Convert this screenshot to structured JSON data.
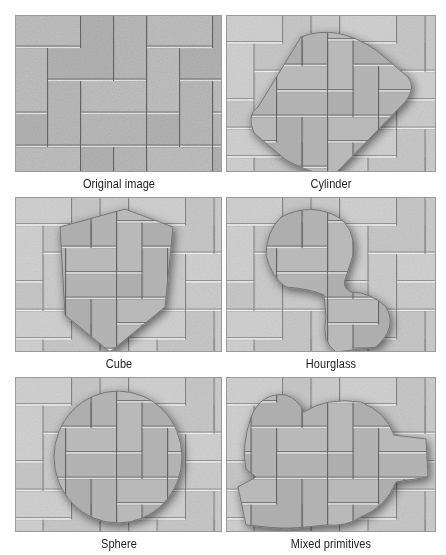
{
  "figure": {
    "panels": [
      {
        "id": "original",
        "caption": "Original image",
        "shape": "none",
        "x": 15,
        "y": 15,
        "w": 207,
        "h": 157,
        "caption_y": 177
      },
      {
        "id": "cylinder",
        "caption": "Cylinder",
        "shape": "cylinder",
        "x": 226,
        "y": 15,
        "w": 210,
        "h": 157,
        "caption_y": 177
      },
      {
        "id": "cube",
        "caption": "Cube",
        "shape": "cube",
        "x": 15,
        "y": 197,
        "w": 207,
        "h": 155,
        "caption_y": 357
      },
      {
        "id": "hourglass",
        "caption": "Hourglass",
        "shape": "hourglass",
        "x": 226,
        "y": 197,
        "w": 210,
        "h": 155,
        "caption_y": 357
      },
      {
        "id": "sphere",
        "caption": "Sphere",
        "shape": "sphere",
        "x": 15,
        "y": 377,
        "w": 207,
        "h": 155,
        "caption_y": 537
      },
      {
        "id": "mixed",
        "caption": "Mixed primitives",
        "shape": "mixed",
        "x": 226,
        "y": 377,
        "w": 210,
        "h": 155,
        "caption_y": 537
      }
    ],
    "colors": {
      "brick_light": "#c9c9c9",
      "brick_base": "#b4b4b4",
      "mortar_dark": "#6e6e6e",
      "mortar_highlight": "#f2f2f2",
      "distort_fill": "#a9a9a9",
      "shadow": "#555555"
    }
  }
}
